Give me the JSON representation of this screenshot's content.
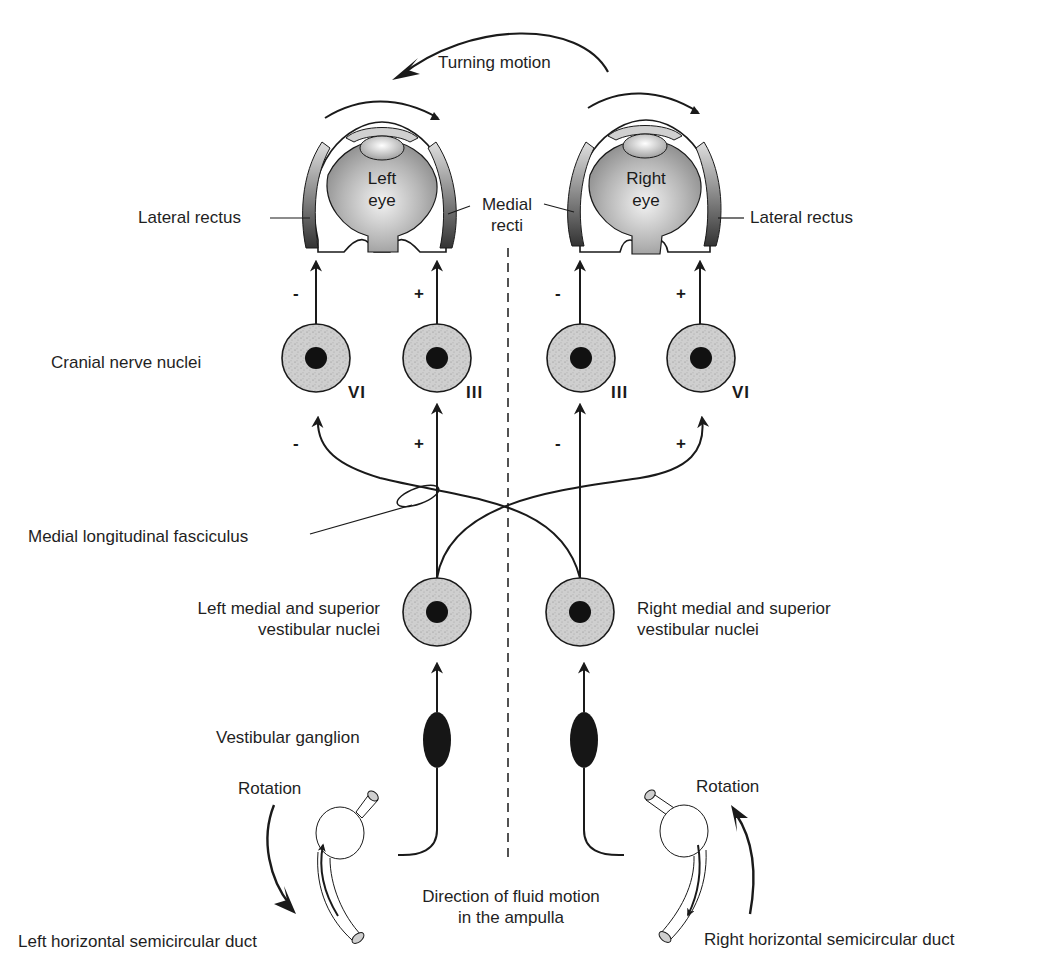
{
  "labels": {
    "turning_motion": "Turning motion",
    "left_eye_line1": "Left",
    "left_eye_line2": "eye",
    "right_eye_line1": "Right",
    "right_eye_line2": "eye",
    "lateral_rectus_left": "Lateral rectus",
    "lateral_rectus_right": "Lateral rectus",
    "medial_recti_line1": "Medial",
    "medial_recti_line2": "recti",
    "cranial_nerve_nuclei": "Cranial nerve nuclei",
    "mlf": "Medial longitudinal fasciculus",
    "left_vestibular_line1": "Left medial and superior",
    "left_vestibular_line2": "vestibular nuclei",
    "right_vestibular_line1": "Right medial and superior",
    "right_vestibular_line2": "vestibular nuclei",
    "vestibular_ganglion": "Vestibular ganglion",
    "rotation_left": "Rotation",
    "rotation_right": "Rotation",
    "fluid_line1": "Direction of fluid motion",
    "fluid_line2": "in the ampulla",
    "left_duct": "Left horizontal semicircular duct",
    "right_duct": "Right horizontal semicircular duct"
  },
  "nuclei": {
    "left_vi": "VI",
    "left_iii": "III",
    "right_iii": "III",
    "right_vi": "VI"
  },
  "signs": {
    "upper_left_vi": "-",
    "upper_left_iii": "+",
    "upper_right_iii": "-",
    "upper_right_vi": "+",
    "lower_left_vi": "-",
    "lower_left_iii": "+",
    "lower_right_iii": "-",
    "lower_right_vi": "+"
  },
  "colors": {
    "ink": "#1a1a1a",
    "nucleus_fill": "#c9c9c9",
    "eye_fill": "#a8a8a8",
    "background": "#ffffff"
  }
}
